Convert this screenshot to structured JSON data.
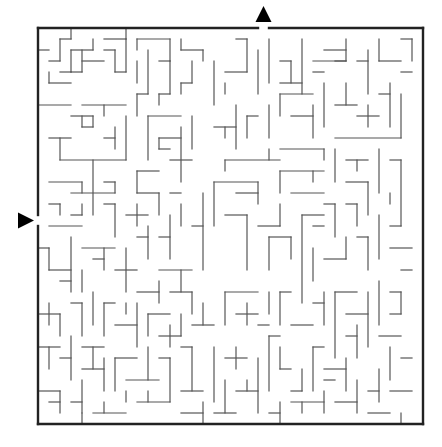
{
  "puzzle": {
    "type": "maze",
    "grid": {
      "origin_x": 38,
      "origin_y": 28,
      "cell": 11,
      "cols": 35,
      "rows": 36
    },
    "entrance": {
      "side": "left",
      "row": 17,
      "arrow": "right-pointing-triangle"
    },
    "exit": {
      "side": "top",
      "col": 20,
      "arrow": "up-pointing-triangle"
    },
    "colors": {
      "wall": "#555555",
      "frame": "#222222",
      "arrow": "#000000",
      "background": "#ffffff"
    },
    "walls": [
      [
        3,
        0,
        3,
        1
      ],
      [
        6,
        1,
        8,
        1
      ],
      [
        8,
        0,
        8,
        1
      ],
      [
        3,
        1,
        2,
        1
      ],
      [
        2,
        1,
        2,
        3
      ],
      [
        0,
        2,
        1,
        2
      ],
      [
        2,
        3,
        1,
        3
      ],
      [
        5,
        1,
        5,
        2
      ],
      [
        5,
        2,
        3,
        2
      ],
      [
        3,
        2,
        3,
        4
      ],
      [
        3,
        4,
        2,
        4
      ],
      [
        1,
        4,
        1,
        5
      ],
      [
        1,
        5,
        3,
        5
      ],
      [
        4,
        3,
        6,
        3
      ],
      [
        4,
        2,
        4,
        4
      ],
      [
        4,
        4,
        3,
        4
      ],
      [
        6,
        2,
        7,
        2
      ],
      [
        7,
        2,
        7,
        4
      ],
      [
        7,
        4,
        8,
        4
      ],
      [
        8,
        1,
        8,
        4
      ],
      [
        9,
        1,
        12,
        1
      ],
      [
        9,
        1,
        9,
        2
      ],
      [
        9,
        3,
        9,
        5
      ],
      [
        10,
        2,
        10,
        6
      ],
      [
        11,
        3,
        12,
        3
      ],
      [
        12,
        1,
        12,
        3
      ],
      [
        13,
        1,
        13,
        2
      ],
      [
        13,
        2,
        15,
        2
      ],
      [
        15,
        2,
        15,
        3
      ],
      [
        14,
        3,
        14,
        5
      ],
      [
        14,
        5,
        13,
        5
      ],
      [
        13,
        5,
        13,
        6
      ],
      [
        12,
        3,
        12,
        6
      ],
      [
        11,
        6,
        12,
        6
      ],
      [
        11,
        6,
        11,
        7
      ],
      [
        9,
        6,
        10,
        6
      ],
      [
        9,
        6,
        9,
        8
      ],
      [
        0,
        7,
        3,
        7
      ],
      [
        4,
        7,
        8,
        7
      ],
      [
        6,
        7,
        6,
        8
      ],
      [
        3,
        8,
        5,
        8
      ],
      [
        5,
        8,
        5,
        9
      ],
      [
        4,
        9,
        5,
        9
      ],
      [
        4,
        8,
        4,
        9
      ],
      [
        1,
        10,
        3,
        10
      ],
      [
        2,
        10,
        2,
        12
      ],
      [
        2,
        12,
        8,
        12
      ],
      [
        7,
        9,
        7,
        11
      ],
      [
        6,
        10,
        7,
        10
      ],
      [
        8,
        8,
        8,
        12
      ],
      [
        10,
        8,
        13,
        8
      ],
      [
        10,
        8,
        10,
        12
      ],
      [
        11,
        10,
        13,
        10
      ],
      [
        11,
        10,
        11,
        11
      ],
      [
        11,
        11,
        12,
        11
      ],
      [
        13,
        9,
        13,
        14
      ],
      [
        12,
        12,
        14,
        12
      ],
      [
        14,
        8,
        14,
        11
      ],
      [
        1,
        14,
        4,
        14
      ],
      [
        5,
        12,
        5,
        17
      ],
      [
        4,
        14,
        4,
        15
      ],
      [
        3,
        15,
        7,
        15
      ],
      [
        6,
        14,
        7,
        14
      ],
      [
        7,
        14,
        7,
        15
      ],
      [
        9,
        13,
        11,
        13
      ],
      [
        9,
        13,
        9,
        15
      ],
      [
        9,
        15,
        11,
        15
      ],
      [
        11,
        15,
        11,
        17
      ],
      [
        12,
        15,
        13,
        15
      ],
      [
        1,
        16,
        2,
        16
      ],
      [
        2,
        16,
        2,
        17
      ],
      [
        1,
        18,
        4,
        18
      ],
      [
        4,
        16,
        4,
        17
      ],
      [
        4,
        17,
        3,
        17
      ],
      [
        6,
        16,
        7,
        16
      ],
      [
        7,
        16,
        7,
        19
      ],
      [
        8,
        17,
        10,
        17
      ],
      [
        9,
        16,
        9,
        18
      ],
      [
        10,
        18,
        10,
        21
      ],
      [
        11,
        19,
        12,
        19
      ],
      [
        12,
        17,
        12,
        21
      ],
      [
        13,
        16,
        13,
        18
      ],
      [
        14,
        18,
        15,
        18
      ],
      [
        15,
        15,
        15,
        22
      ],
      [
        16,
        3,
        16,
        7
      ],
      [
        17,
        4,
        19,
        4
      ],
      [
        18,
        1,
        19,
        1
      ],
      [
        19,
        1,
        19,
        4
      ],
      [
        17,
        5,
        17,
        6
      ],
      [
        20,
        2,
        20,
        6
      ],
      [
        21,
        1,
        21,
        5
      ],
      [
        22,
        3,
        23,
        3
      ],
      [
        23,
        3,
        23,
        5
      ],
      [
        22,
        5,
        24,
        5
      ],
      [
        24,
        1,
        24,
        6
      ],
      [
        25,
        3,
        28,
        3
      ],
      [
        25,
        4,
        26,
        4
      ],
      [
        26,
        2,
        28,
        2
      ],
      [
        28,
        1,
        28,
        3
      ],
      [
        28,
        3,
        27,
        3
      ],
      [
        29,
        3,
        30,
        3
      ],
      [
        30,
        2,
        30,
        6
      ],
      [
        31,
        1,
        31,
        3
      ],
      [
        31,
        3,
        33,
        3
      ],
      [
        33,
        1,
        34,
        1
      ],
      [
        34,
        1,
        34,
        3
      ],
      [
        33,
        4,
        34,
        4
      ],
      [
        16,
        9,
        18,
        9
      ],
      [
        17,
        9,
        17,
        10
      ],
      [
        18,
        7,
        18,
        11
      ],
      [
        19,
        8,
        20,
        8
      ],
      [
        19,
        8,
        19,
        10
      ],
      [
        21,
        7,
        21,
        10
      ],
      [
        22,
        6,
        25,
        6
      ],
      [
        22,
        6,
        22,
        8
      ],
      [
        23,
        8,
        25,
        8
      ],
      [
        26,
        5,
        26,
        9
      ],
      [
        25,
        7,
        25,
        10
      ],
      [
        27,
        7,
        29,
        7
      ],
      [
        28,
        5,
        28,
        7
      ],
      [
        29,
        8,
        31,
        8
      ],
      [
        30,
        7,
        30,
        9
      ],
      [
        31,
        6,
        32,
        6
      ],
      [
        32,
        5,
        32,
        9
      ],
      [
        27,
        10,
        33,
        10
      ],
      [
        33,
        6,
        33,
        10
      ],
      [
        17,
        12,
        22,
        12
      ],
      [
        17,
        12,
        17,
        13
      ],
      [
        21,
        11,
        21,
        12
      ],
      [
        22,
        11,
        26,
        11
      ],
      [
        26,
        11,
        26,
        12
      ],
      [
        27,
        11,
        27,
        14
      ],
      [
        28,
        12,
        30,
        12
      ],
      [
        29,
        12,
        29,
        13
      ],
      [
        31,
        11,
        31,
        15
      ],
      [
        16,
        14,
        20,
        14
      ],
      [
        16,
        14,
        16,
        18
      ],
      [
        18,
        15,
        20,
        15
      ],
      [
        20,
        14,
        20,
        16
      ],
      [
        22,
        13,
        26,
        13
      ],
      [
        22,
        13,
        22,
        15
      ],
      [
        23,
        15,
        26,
        15
      ],
      [
        25,
        13,
        25,
        14
      ],
      [
        28,
        14,
        30,
        14
      ],
      [
        30,
        14,
        30,
        17
      ],
      [
        32,
        12,
        33,
        12
      ],
      [
        33,
        12,
        33,
        18
      ],
      [
        32,
        15,
        32,
        16
      ],
      [
        28,
        16,
        29,
        16
      ],
      [
        29,
        16,
        29,
        18
      ],
      [
        26,
        16,
        27,
        16
      ],
      [
        27,
        16,
        27,
        19
      ],
      [
        17,
        17,
        19,
        17
      ],
      [
        19,
        17,
        19,
        22
      ],
      [
        20,
        18,
        22,
        18
      ],
      [
        22,
        16,
        22,
        18
      ],
      [
        21,
        19,
        23,
        19
      ],
      [
        21,
        19,
        21,
        22
      ],
      [
        23,
        19,
        23,
        21
      ],
      [
        24,
        17,
        26,
        17
      ],
      [
        24,
        17,
        24,
        25
      ],
      [
        25,
        18,
        26,
        18
      ],
      [
        25,
        20,
        25,
        23
      ],
      [
        26,
        21,
        28,
        21
      ],
      [
        28,
        19,
        28,
        21
      ],
      [
        29,
        19,
        30,
        19
      ],
      [
        30,
        19,
        30,
        22
      ],
      [
        31,
        17,
        31,
        21
      ],
      [
        32,
        18,
        33,
        18
      ],
      [
        32,
        20,
        34,
        20
      ],
      [
        33,
        22,
        34,
        22
      ],
      [
        0,
        20,
        1,
        20
      ],
      [
        1,
        20,
        1,
        22
      ],
      [
        1,
        22,
        3,
        22
      ],
      [
        3,
        19,
        3,
        24
      ],
      [
        2,
        23,
        3,
        23
      ],
      [
        4,
        20,
        7,
        20
      ],
      [
        6,
        20,
        6,
        22
      ],
      [
        5,
        21,
        6,
        21
      ],
      [
        4,
        22,
        4,
        24
      ],
      [
        7,
        22,
        9,
        22
      ],
      [
        8,
        20,
        8,
        24
      ],
      [
        9,
        19,
        10,
        19
      ],
      [
        11,
        22,
        14,
        22
      ],
      [
        13,
        22,
        13,
        24
      ],
      [
        11,
        23,
        11,
        25
      ],
      [
        12,
        24,
        14,
        24
      ],
      [
        14,
        24,
        14,
        26
      ],
      [
        9,
        24,
        11,
        24
      ],
      [
        0,
        26,
        2,
        26
      ],
      [
        1,
        25,
        1,
        27
      ],
      [
        2,
        26,
        2,
        28
      ],
      [
        3,
        25,
        4,
        25
      ],
      [
        4,
        25,
        4,
        28
      ],
      [
        5,
        24,
        5,
        27
      ],
      [
        6,
        25,
        7,
        25
      ],
      [
        6,
        25,
        6,
        28
      ],
      [
        7,
        27,
        9,
        27
      ],
      [
        8,
        25,
        8,
        26
      ],
      [
        9,
        25,
        9,
        29
      ],
      [
        10,
        26,
        12,
        26
      ],
      [
        10,
        26,
        10,
        28
      ],
      [
        11,
        28,
        13,
        28
      ],
      [
        12,
        27,
        12,
        29
      ],
      [
        13,
        26,
        13,
        28
      ],
      [
        14,
        27,
        16,
        27
      ],
      [
        15,
        25,
        15,
        27
      ],
      [
        0,
        29,
        2,
        29
      ],
      [
        1,
        29,
        1,
        31
      ],
      [
        2,
        30,
        3,
        30
      ],
      [
        3,
        28,
        3,
        32
      ],
      [
        4,
        29,
        6,
        29
      ],
      [
        5,
        29,
        5,
        31
      ],
      [
        4,
        31,
        6,
        31
      ],
      [
        6,
        30,
        6,
        33
      ],
      [
        7,
        30,
        9,
        30
      ],
      [
        7,
        30,
        7,
        33
      ],
      [
        8,
        32,
        11,
        32
      ],
      [
        10,
        29,
        10,
        32
      ],
      [
        11,
        30,
        12,
        30
      ],
      [
        12,
        30,
        12,
        34
      ],
      [
        13,
        29,
        14,
        29
      ],
      [
        14,
        29,
        14,
        33
      ],
      [
        13,
        33,
        15,
        33
      ],
      [
        0,
        33,
        2,
        33
      ],
      [
        2,
        33,
        2,
        35
      ],
      [
        1,
        34,
        2,
        34
      ],
      [
        3,
        34,
        4,
        34
      ],
      [
        4,
        32,
        4,
        35
      ],
      [
        5,
        35,
        8,
        35
      ],
      [
        6,
        34,
        6,
        35
      ],
      [
        8,
        33,
        8,
        34
      ],
      [
        9,
        34,
        12,
        34
      ],
      [
        10,
        33,
        10,
        34
      ],
      [
        13,
        35,
        15,
        35
      ],
      [
        15,
        34,
        15,
        36
      ],
      [
        16,
        29,
        16,
        34
      ],
      [
        17,
        30,
        19,
        30
      ],
      [
        18,
        29,
        18,
        31
      ],
      [
        17,
        32,
        17,
        35
      ],
      [
        18,
        33,
        20,
        33
      ],
      [
        19,
        32,
        19,
        33
      ],
      [
        20,
        30,
        20,
        35
      ],
      [
        21,
        28,
        22,
        28
      ],
      [
        21,
        28,
        21,
        33
      ],
      [
        22,
        31,
        23,
        31
      ],
      [
        22,
        29,
        22,
        31
      ],
      [
        23,
        33,
        24,
        33
      ],
      [
        24,
        31,
        24,
        33
      ],
      [
        17,
        24,
        20,
        24
      ],
      [
        17,
        24,
        17,
        27
      ],
      [
        18,
        26,
        20,
        26
      ],
      [
        19,
        25,
        19,
        27
      ],
      [
        20,
        27,
        21,
        27
      ],
      [
        21,
        24,
        21,
        26
      ],
      [
        22,
        24,
        23,
        24
      ],
      [
        22,
        24,
        22,
        27
      ],
      [
        23,
        27,
        25,
        27
      ],
      [
        25,
        25,
        26,
        25
      ],
      [
        26,
        24,
        26,
        27
      ],
      [
        27,
        24,
        29,
        24
      ],
      [
        27,
        24,
        27,
        30
      ],
      [
        28,
        26,
        30,
        26
      ],
      [
        28,
        28,
        29,
        28
      ],
      [
        29,
        27,
        29,
        30
      ],
      [
        30,
        24,
        30,
        29
      ],
      [
        31,
        23,
        31,
        27
      ],
      [
        32,
        24,
        33,
        24
      ],
      [
        32,
        26,
        33,
        26
      ],
      [
        33,
        24,
        33,
        26
      ],
      [
        31,
        28,
        33,
        28
      ],
      [
        32,
        29,
        32,
        32
      ],
      [
        33,
        30,
        34,
        30
      ],
      [
        31,
        31,
        31,
        34
      ],
      [
        32,
        33,
        34,
        33
      ],
      [
        30,
        33,
        31,
        33
      ],
      [
        25,
        29,
        26,
        29
      ],
      [
        25,
        29,
        25,
        33
      ],
      [
        26,
        31,
        28,
        31
      ],
      [
        28,
        30,
        28,
        33
      ],
      [
        26,
        32,
        27,
        32
      ],
      [
        23,
        34,
        26,
        34
      ],
      [
        24,
        34,
        24,
        35
      ],
      [
        26,
        33,
        26,
        35
      ],
      [
        27,
        34,
        29,
        34
      ],
      [
        29,
        32,
        29,
        35
      ],
      [
        16,
        35,
        18,
        35
      ],
      [
        21,
        35,
        22,
        35
      ],
      [
        22,
        34,
        22,
        36
      ],
      [
        30,
        35,
        32,
        35
      ],
      [
        33,
        35,
        33,
        36
      ],
      [
        4,
        36,
        4,
        35
      ]
    ]
  }
}
